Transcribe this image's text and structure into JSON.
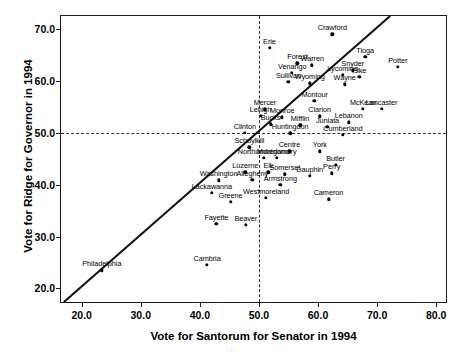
{
  "chart_data": {
    "type": "scatter",
    "title": "",
    "xlabel": "Vote for Santorum for Senator in 1994",
    "ylabel": "Vote for Ridge for Governor in 1994",
    "xlim": [
      16.5,
      82.0
    ],
    "ylim": [
      17.0,
      72.5
    ],
    "xticks": [
      "20.0",
      "30.0",
      "40.0",
      "50.0",
      "60.0",
      "70.0",
      "80.0"
    ],
    "xtick_values": [
      20,
      30,
      40,
      50,
      60,
      70,
      80
    ],
    "yticks": [
      "20.0",
      "30.0",
      "40.0",
      "50.0",
      "60.0",
      "70.0"
    ],
    "ytick_values": [
      20,
      30,
      40,
      50,
      60,
      70
    ],
    "grid": false,
    "reference_lines": [
      {
        "type": "hline",
        "value": 50,
        "style": "dashed"
      },
      {
        "type": "vline",
        "value": 50,
        "style": "dashed"
      },
      {
        "type": "identity",
        "style": "solid",
        "note": "y = x diagonal line"
      }
    ],
    "legend": "none",
    "point_label_position": "above",
    "points": [
      {
        "name": "Crawford",
        "x": 62.4,
        "y": 69.0
      },
      {
        "name": "Erie",
        "x": 51.8,
        "y": 66.4
      },
      {
        "name": "Tioga",
        "x": 68.0,
        "y": 64.6
      },
      {
        "name": "Potter",
        "x": 73.5,
        "y": 62.7
      },
      {
        "name": "Warren",
        "x": 59.0,
        "y": 63.0
      },
      {
        "name": "Forest",
        "x": 56.5,
        "y": 63.4
      },
      {
        "name": "Snyder",
        "x": 65.9,
        "y": 62.0
      },
      {
        "name": "Venango",
        "x": 55.6,
        "y": 61.5
      },
      {
        "name": "Pike",
        "x": 67.0,
        "y": 60.8
      },
      {
        "name": "Lycoming",
        "x": 64.2,
        "y": 61.2
      },
      {
        "name": "Sullivan",
        "x": 55.0,
        "y": 59.8
      },
      {
        "name": "Wyoming",
        "x": 58.6,
        "y": 59.5
      },
      {
        "name": "Wayne",
        "x": 64.5,
        "y": 59.3
      },
      {
        "name": "Montour",
        "x": 59.4,
        "y": 56.2
      },
      {
        "name": "Mercer",
        "x": 51.0,
        "y": 54.5
      },
      {
        "name": "McKean",
        "x": 67.6,
        "y": 54.6
      },
      {
        "name": "Lancaster",
        "x": 70.8,
        "y": 54.6
      },
      {
        "name": "Lehigh",
        "x": 50.3,
        "y": 53.3
      },
      {
        "name": "Monroe",
        "x": 53.9,
        "y": 53.0
      },
      {
        "name": "Clarion",
        "x": 60.3,
        "y": 53.2
      },
      {
        "name": "Bucks",
        "x": 52.0,
        "y": 51.6
      },
      {
        "name": "Mifflin",
        "x": 57.0,
        "y": 51.4
      },
      {
        "name": "Juniata",
        "x": 61.6,
        "y": 51.2
      },
      {
        "name": "Lebanon",
        "x": 65.2,
        "y": 52.0
      },
      {
        "name": "Clinton",
        "x": 47.6,
        "y": 50.0
      },
      {
        "name": "Huntingdon",
        "x": 55.3,
        "y": 49.9
      },
      {
        "name": "Cumberland",
        "x": 64.2,
        "y": 49.6
      },
      {
        "name": "Schuylkill",
        "x": 48.4,
        "y": 47.2
      },
      {
        "name": "Centre",
        "x": 55.2,
        "y": 46.4
      },
      {
        "name": "York",
        "x": 60.3,
        "y": 46.4
      },
      {
        "name": "Northumberland",
        "x": 50.8,
        "y": 45.2
      },
      {
        "name": "Montgomery",
        "x": 53.0,
        "y": 45.2
      },
      {
        "name": "Butler",
        "x": 63.0,
        "y": 43.8
      },
      {
        "name": "Perry",
        "x": 62.3,
        "y": 42.2
      },
      {
        "name": "Luzerne",
        "x": 47.7,
        "y": 42.4
      },
      {
        "name": "Elk",
        "x": 51.6,
        "y": 42.4
      },
      {
        "name": "Somerset",
        "x": 54.4,
        "y": 42.0
      },
      {
        "name": "Dauphin",
        "x": 58.6,
        "y": 41.7
      },
      {
        "name": "Washington",
        "x": 43.2,
        "y": 40.8
      },
      {
        "name": "Allegheny",
        "x": 48.9,
        "y": 40.9
      },
      {
        "name": "Armstrong",
        "x": 53.6,
        "y": 40.0
      },
      {
        "name": "Lackawanna",
        "x": 42.0,
        "y": 38.4
      },
      {
        "name": "Greene",
        "x": 45.2,
        "y": 36.7
      },
      {
        "name": "Westmoreland",
        "x": 51.2,
        "y": 37.5
      },
      {
        "name": "Cameron",
        "x": 61.8,
        "y": 37.2
      },
      {
        "name": "Fayette",
        "x": 42.8,
        "y": 32.4
      },
      {
        "name": "Beaver",
        "x": 47.8,
        "y": 32.3
      },
      {
        "name": "Cambria",
        "x": 41.2,
        "y": 24.5
      },
      {
        "name": "Philadelphia",
        "x": 23.4,
        "y": 23.5
      }
    ]
  }
}
